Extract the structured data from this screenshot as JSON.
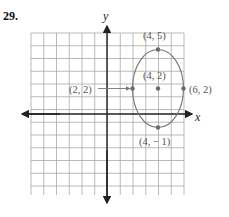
{
  "problem": {
    "number": "29."
  },
  "chart_data": {
    "type": "scatter",
    "title": "",
    "xlabel": "x",
    "ylabel": "y",
    "xlim": [
      -6,
      6
    ],
    "ylim": [
      -6,
      6
    ],
    "grid": true,
    "shape": {
      "type": "ellipse",
      "center": [
        4,
        2
      ],
      "rx": 2,
      "ry": 3
    },
    "points": [
      {
        "x": 4,
        "y": 5,
        "label": "(4, 5)"
      },
      {
        "x": 4,
        "y": 2,
        "label": "(4, 2)"
      },
      {
        "x": 6,
        "y": 2,
        "label": "(6, 2)"
      },
      {
        "x": 2,
        "y": 2,
        "label": "(2, 2)"
      },
      {
        "x": 4,
        "y": -1,
        "label": "(4, − 1)"
      }
    ],
    "annotations": [
      {
        "text": "(2, 2)",
        "arrow_to": [
          2,
          2
        ]
      }
    ]
  },
  "labels": {
    "x_axis": "x",
    "y_axis": "y",
    "p_top": "(4, 5)",
    "p_center": "(4, 2)",
    "p_right": "(6, 2)",
    "p_left": "(2, 2)",
    "p_bottom": "(4, − 1)"
  },
  "colors": {
    "grid": "#a8a8a8",
    "axis": "#222222",
    "curve": "#777777",
    "point": "#6a6a6a"
  }
}
